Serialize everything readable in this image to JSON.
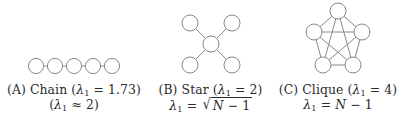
{
  "figure": {
    "background_color": "#ffffff",
    "node_stroke_color": "#8a8a8a",
    "edge_stroke_color": "#8a8a8a",
    "text_color": "#2b2b2b"
  },
  "panels": {
    "chain": {
      "caption_line1": "(A) Chain (λ₁ = 1.73)",
      "caption_line2": "(λ₁ ≈ 2)",
      "label": "(A)",
      "name": "Chain",
      "lambda_value": "1.73",
      "lambda_formula": "≈ 2",
      "node_count": 5,
      "edge_count": 4
    },
    "star": {
      "caption_line1": "(B) Star (λ₁ = 2)",
      "caption_line2": "λ₁ = √(N − 1)",
      "label": "(B)",
      "name": "Star",
      "lambda_value": "2",
      "lambda_formula": "sqrt(N - 1)",
      "formula_variable": "N",
      "formula_operator": "−",
      "formula_constant": "1",
      "node_count": 5,
      "edge_count": 4
    },
    "clique": {
      "caption_line1": "(C) Clique (λ₁ = 4)",
      "caption_line2": "λ₁ = N − 1",
      "label": "(C)",
      "name": "Clique",
      "lambda_value": "4",
      "lambda_formula": "N - 1",
      "formula_variable": "N",
      "formula_operator": "−",
      "formula_constant": "1",
      "node_count": 5,
      "edge_count": 10
    }
  },
  "symbols": {
    "lambda": "λ",
    "subscript_one": "1",
    "equals": "=",
    "approx": "≈",
    "minus": "−",
    "radical": "√",
    "paren_open": "(",
    "paren_close": ")"
  }
}
